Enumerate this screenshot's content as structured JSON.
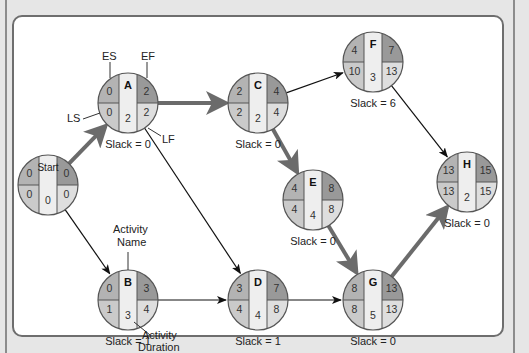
{
  "diagram": {
    "type": "activity-on-node network (critical path)",
    "legend_labels": {
      "es": "ES",
      "ef": "EF",
      "ls": "LS",
      "lf": "LF",
      "activity_name": [
        "Activity",
        "Name"
      ],
      "activity_duration": [
        "Activity",
        "Duration"
      ]
    },
    "colors": {
      "es_fill": "#b3b3b3",
      "ef_fill": "#999999",
      "ls_fill": "#cacaca",
      "lf_fill": "#dedede",
      "center_fill": "#eeeeee",
      "critical_arrow": "#6b6b6b",
      "normal_arrow": "#111111"
    },
    "nodes": [
      {
        "id": "Start",
        "name": "Start",
        "es": "0",
        "ef": "0",
        "ls": "0",
        "lf": "0",
        "duration": "0",
        "slack": "",
        "cx": 48,
        "cy": 185
      },
      {
        "id": "A",
        "name": "A",
        "es": "0",
        "ef": "2",
        "ls": "0",
        "lf": "2",
        "duration": "2",
        "slack": "Slack = 0",
        "cx": 128,
        "cy": 103
      },
      {
        "id": "B",
        "name": "B",
        "es": "0",
        "ef": "3",
        "ls": "1",
        "lf": "4",
        "duration": "3",
        "slack": "Slack = 1",
        "cx": 128,
        "cy": 300
      },
      {
        "id": "C",
        "name": "C",
        "es": "2",
        "ef": "4",
        "ls": "2",
        "lf": "4",
        "duration": "2",
        "slack": "Slack = 0",
        "cx": 258,
        "cy": 103
      },
      {
        "id": "D",
        "name": "D",
        "es": "3",
        "ef": "7",
        "ls": "4",
        "lf": "8",
        "duration": "4",
        "slack": "Slack = 1",
        "cx": 258,
        "cy": 300
      },
      {
        "id": "E",
        "name": "E",
        "es": "4",
        "ef": "8",
        "ls": "4",
        "lf": "8",
        "duration": "4",
        "slack": "Slack = 0",
        "cx": 313,
        "cy": 200
      },
      {
        "id": "F",
        "name": "F",
        "es": "4",
        "ef": "7",
        "ls": "10",
        "lf": "13",
        "duration": "3",
        "slack": "Slack = 6",
        "cx": 373,
        "cy": 62
      },
      {
        "id": "G",
        "name": "G",
        "es": "8",
        "ef": "13",
        "ls": "8",
        "lf": "13",
        "duration": "5",
        "slack": "Slack = 0",
        "cx": 373,
        "cy": 300
      },
      {
        "id": "H",
        "name": "H",
        "es": "13",
        "ef": "15",
        "ls": "13",
        "lf": "15",
        "duration": "2",
        "slack": "Slack = 0",
        "cx": 467,
        "cy": 182
      }
    ],
    "edges": [
      {
        "from": "Start",
        "to": "A",
        "critical": true
      },
      {
        "from": "Start",
        "to": "B",
        "critical": false
      },
      {
        "from": "A",
        "to": "C",
        "critical": true
      },
      {
        "from": "A",
        "to": "D",
        "critical": false
      },
      {
        "from": "B",
        "to": "D",
        "critical": false
      },
      {
        "from": "C",
        "to": "E",
        "critical": true
      },
      {
        "from": "C",
        "to": "F",
        "critical": false
      },
      {
        "from": "D",
        "to": "G",
        "critical": false
      },
      {
        "from": "E",
        "to": "G",
        "critical": true
      },
      {
        "from": "F",
        "to": "H",
        "critical": false
      },
      {
        "from": "G",
        "to": "H",
        "critical": true
      }
    ]
  }
}
